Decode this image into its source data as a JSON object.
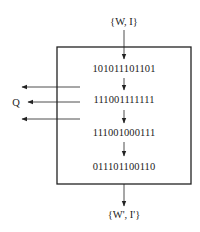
{
  "diagram": {
    "input_label": "{W, I}",
    "output_label": "{W', I'}",
    "side_output_label": "Q",
    "states": [
      "101011101101",
      "111001111111",
      "111001000111",
      "011101100110"
    ],
    "colors": {
      "stroke": "#222222",
      "background": "#ffffff"
    }
  }
}
